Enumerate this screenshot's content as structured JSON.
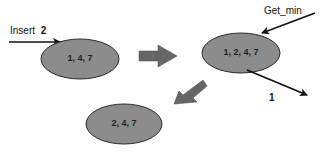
{
  "diagram": {
    "colors": {
      "node_fill": "#8c8c8c",
      "node_stroke": "#2a2a2a",
      "arrow": "#111111",
      "block_arrow": "#666666"
    },
    "nodes": [
      {
        "id": "heap-initial",
        "label": "1, 4, 7"
      },
      {
        "id": "heap-after-insert",
        "label": "1, 2, 4, 7"
      },
      {
        "id": "heap-after-getmin",
        "label": "2, 4, 7"
      }
    ],
    "operations": {
      "insert": {
        "label": "Insert",
        "value": "2"
      },
      "get_min": {
        "label": "Get_min"
      },
      "output": {
        "value": "1"
      }
    }
  }
}
